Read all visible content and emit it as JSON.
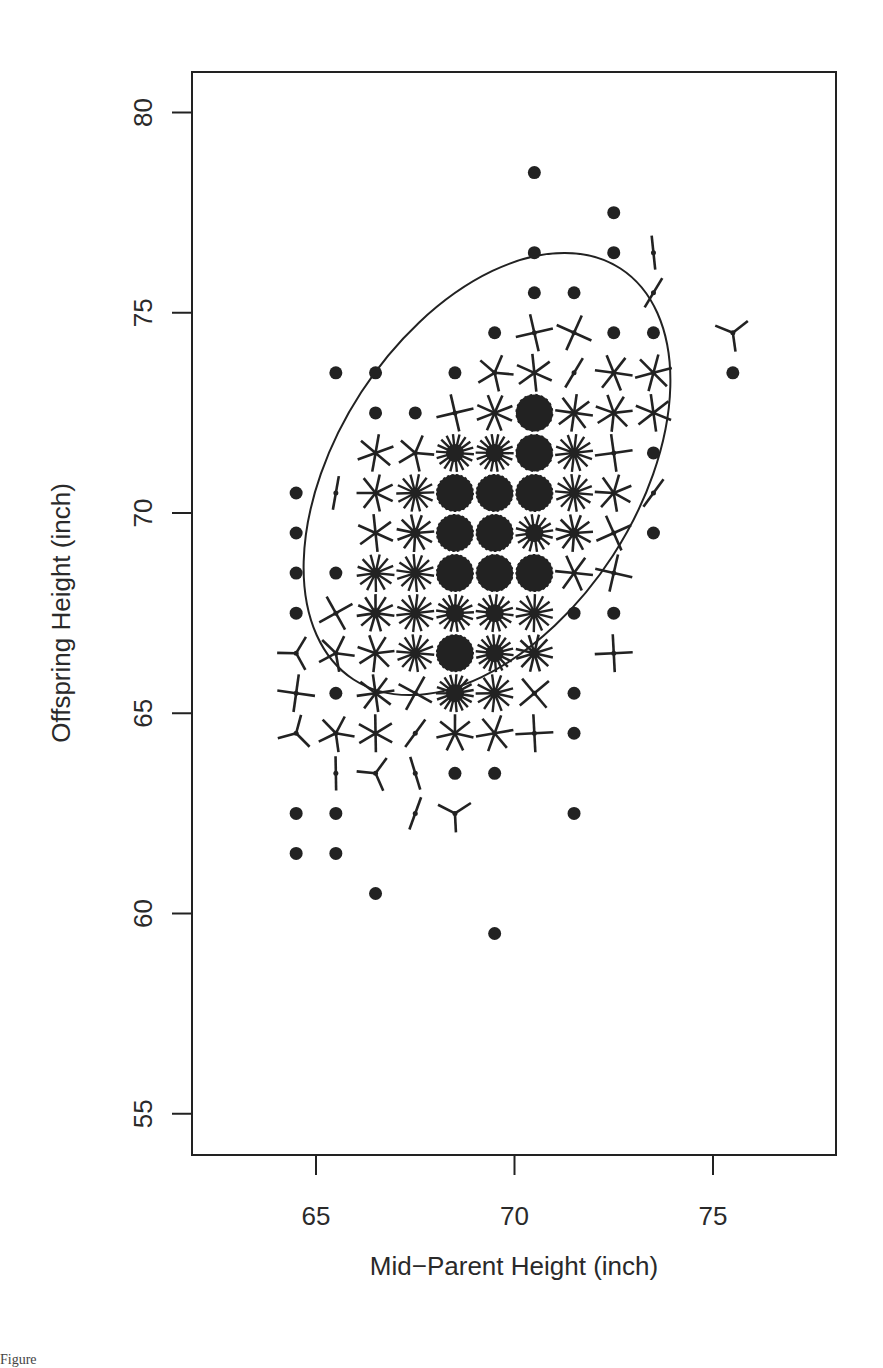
{
  "chart_data": {
    "type": "scatter",
    "subtype": "sunflower",
    "title": "",
    "xlabel": "Mid−Parent Height (inch)",
    "ylabel": "Offspring Height (inch)",
    "xlim": [
      61.9,
      78.2
    ],
    "ylim": [
      54.0,
      81.0
    ],
    "xticks": [
      65,
      70,
      75
    ],
    "yticks": [
      55,
      60,
      65,
      70,
      75,
      80
    ],
    "xtick_labels": [
      "65",
      "70",
      "75"
    ],
    "ytick_labels": [
      "55",
      "60",
      "65",
      "70",
      "75",
      "80"
    ],
    "grid": false,
    "legend": null,
    "ellipse": {
      "center": [
        69.3,
        69.2
      ],
      "note": "concentration ellipse, tilted ~positive correlation"
    },
    "points_legend": "Each symbol marks a grid cell; a dot = 1 observation, each petal = 1 observation, dense cells drawn as filled disks",
    "points": [
      {
        "x": 70.5,
        "y": 78.5,
        "n": 1
      },
      {
        "x": 72.5,
        "y": 77.5,
        "n": 1
      },
      {
        "x": 70.5,
        "y": 76.5,
        "n": 1
      },
      {
        "x": 72.5,
        "y": 76.5,
        "n": 1
      },
      {
        "x": 73.5,
        "y": 76.5,
        "n": 2
      },
      {
        "x": 70.5,
        "y": 75.5,
        "n": 1
      },
      {
        "x": 71.5,
        "y": 75.5,
        "n": 1
      },
      {
        "x": 73.5,
        "y": 75.5,
        "n": 2
      },
      {
        "x": 69.5,
        "y": 74.5,
        "n": 1
      },
      {
        "x": 70.5,
        "y": 74.5,
        "n": 4
      },
      {
        "x": 71.5,
        "y": 74.5,
        "n": 4
      },
      {
        "x": 72.5,
        "y": 74.5,
        "n": 1
      },
      {
        "x": 73.5,
        "y": 74.5,
        "n": 1
      },
      {
        "x": 75.5,
        "y": 74.5,
        "n": 3
      },
      {
        "x": 65.5,
        "y": 73.5,
        "n": 1
      },
      {
        "x": 66.5,
        "y": 73.5,
        "n": 1
      },
      {
        "x": 68.5,
        "y": 73.5,
        "n": 1
      },
      {
        "x": 69.5,
        "y": 73.5,
        "n": 5
      },
      {
        "x": 70.5,
        "y": 73.5,
        "n": 6
      },
      {
        "x": 71.5,
        "y": 73.5,
        "n": 2
      },
      {
        "x": 72.5,
        "y": 73.5,
        "n": 6
      },
      {
        "x": 73.5,
        "y": 73.5,
        "n": 6
      },
      {
        "x": 75.5,
        "y": 73.5,
        "n": 1
      },
      {
        "x": 66.5,
        "y": 72.5,
        "n": 1
      },
      {
        "x": 67.5,
        "y": 72.5,
        "n": 1
      },
      {
        "x": 68.5,
        "y": 72.5,
        "n": 4
      },
      {
        "x": 69.5,
        "y": 72.5,
        "n": 8
      },
      {
        "x": 70.5,
        "y": 72.5,
        "n": 20
      },
      {
        "x": 71.5,
        "y": 72.5,
        "n": 8
      },
      {
        "x": 72.5,
        "y": 72.5,
        "n": 7
      },
      {
        "x": 73.5,
        "y": 72.5,
        "n": 6
      },
      {
        "x": 66.5,
        "y": 71.5,
        "n": 6
      },
      {
        "x": 67.5,
        "y": 71.5,
        "n": 5
      },
      {
        "x": 68.5,
        "y": 71.5,
        "n": 18
      },
      {
        "x": 69.5,
        "y": 71.5,
        "n": 18
      },
      {
        "x": 70.5,
        "y": 71.5,
        "n": 20
      },
      {
        "x": 71.5,
        "y": 71.5,
        "n": 14
      },
      {
        "x": 72.5,
        "y": 71.5,
        "n": 4
      },
      {
        "x": 73.5,
        "y": 71.5,
        "n": 1
      },
      {
        "x": 64.5,
        "y": 70.5,
        "n": 1
      },
      {
        "x": 65.5,
        "y": 70.5,
        "n": 2
      },
      {
        "x": 66.5,
        "y": 70.5,
        "n": 7
      },
      {
        "x": 67.5,
        "y": 70.5,
        "n": 14
      },
      {
        "x": 68.5,
        "y": 70.5,
        "n": 25
      },
      {
        "x": 69.5,
        "y": 70.5,
        "n": 25
      },
      {
        "x": 70.5,
        "y": 70.5,
        "n": 25
      },
      {
        "x": 71.5,
        "y": 70.5,
        "n": 14
      },
      {
        "x": 72.5,
        "y": 70.5,
        "n": 7
      },
      {
        "x": 73.5,
        "y": 70.5,
        "n": 2
      },
      {
        "x": 64.5,
        "y": 69.5,
        "n": 1
      },
      {
        "x": 66.5,
        "y": 69.5,
        "n": 6
      },
      {
        "x": 67.5,
        "y": 69.5,
        "n": 11
      },
      {
        "x": 68.5,
        "y": 69.5,
        "n": 25
      },
      {
        "x": 69.5,
        "y": 69.5,
        "n": 25
      },
      {
        "x": 70.5,
        "y": 69.5,
        "n": 16
      },
      {
        "x": 71.5,
        "y": 69.5,
        "n": 11
      },
      {
        "x": 72.5,
        "y": 69.5,
        "n": 4
      },
      {
        "x": 73.5,
        "y": 69.5,
        "n": 1
      },
      {
        "x": 64.5,
        "y": 68.5,
        "n": 1
      },
      {
        "x": 65.5,
        "y": 68.5,
        "n": 1
      },
      {
        "x": 66.5,
        "y": 68.5,
        "n": 13
      },
      {
        "x": 67.5,
        "y": 68.5,
        "n": 14
      },
      {
        "x": 68.5,
        "y": 68.5,
        "n": 25
      },
      {
        "x": 69.5,
        "y": 68.5,
        "n": 22
      },
      {
        "x": 70.5,
        "y": 68.5,
        "n": 24
      },
      {
        "x": 71.5,
        "y": 68.5,
        "n": 6
      },
      {
        "x": 72.5,
        "y": 68.5,
        "n": 4
      },
      {
        "x": 64.5,
        "y": 67.5,
        "n": 1
      },
      {
        "x": 65.5,
        "y": 67.5,
        "n": 4
      },
      {
        "x": 66.5,
        "y": 67.5,
        "n": 11
      },
      {
        "x": 67.5,
        "y": 67.5,
        "n": 14
      },
      {
        "x": 68.5,
        "y": 67.5,
        "n": 17
      },
      {
        "x": 69.5,
        "y": 67.5,
        "n": 16
      },
      {
        "x": 70.5,
        "y": 67.5,
        "n": 14
      },
      {
        "x": 71.5,
        "y": 67.5,
        "n": 1
      },
      {
        "x": 72.5,
        "y": 67.5,
        "n": 1
      },
      {
        "x": 64.5,
        "y": 66.5,
        "n": 3
      },
      {
        "x": 65.5,
        "y": 66.5,
        "n": 5
      },
      {
        "x": 66.5,
        "y": 66.5,
        "n": 7
      },
      {
        "x": 67.5,
        "y": 66.5,
        "n": 14
      },
      {
        "x": 68.5,
        "y": 66.5,
        "n": 25
      },
      {
        "x": 69.5,
        "y": 66.5,
        "n": 18
      },
      {
        "x": 70.5,
        "y": 66.5,
        "n": 12
      },
      {
        "x": 72.5,
        "y": 66.5,
        "n": 4
      },
      {
        "x": 64.5,
        "y": 65.5,
        "n": 4
      },
      {
        "x": 65.5,
        "y": 65.5,
        "n": 1
      },
      {
        "x": 66.5,
        "y": 65.5,
        "n": 8
      },
      {
        "x": 67.5,
        "y": 65.5,
        "n": 4
      },
      {
        "x": 68.5,
        "y": 65.5,
        "n": 19
      },
      {
        "x": 69.5,
        "y": 65.5,
        "n": 13
      },
      {
        "x": 70.5,
        "y": 65.5,
        "n": 4
      },
      {
        "x": 71.5,
        "y": 65.5,
        "n": 1
      },
      {
        "x": 64.5,
        "y": 64.5,
        "n": 3
      },
      {
        "x": 65.5,
        "y": 64.5,
        "n": 5
      },
      {
        "x": 66.5,
        "y": 64.5,
        "n": 6
      },
      {
        "x": 67.5,
        "y": 64.5,
        "n": 2
      },
      {
        "x": 68.5,
        "y": 64.5,
        "n": 7
      },
      {
        "x": 69.5,
        "y": 64.5,
        "n": 6
      },
      {
        "x": 70.5,
        "y": 64.5,
        "n": 4
      },
      {
        "x": 71.5,
        "y": 64.5,
        "n": 1
      },
      {
        "x": 65.5,
        "y": 63.5,
        "n": 2
      },
      {
        "x": 66.5,
        "y": 63.5,
        "n": 3
      },
      {
        "x": 67.5,
        "y": 63.5,
        "n": 2
      },
      {
        "x": 68.5,
        "y": 63.5,
        "n": 1
      },
      {
        "x": 69.5,
        "y": 63.5,
        "n": 1
      },
      {
        "x": 64.5,
        "y": 62.5,
        "n": 1
      },
      {
        "x": 65.5,
        "y": 62.5,
        "n": 1
      },
      {
        "x": 67.5,
        "y": 62.5,
        "n": 2
      },
      {
        "x": 68.5,
        "y": 62.5,
        "n": 3
      },
      {
        "x": 71.5,
        "y": 62.5,
        "n": 1
      },
      {
        "x": 64.5,
        "y": 61.5,
        "n": 1
      },
      {
        "x": 65.5,
        "y": 61.5,
        "n": 1
      },
      {
        "x": 66.5,
        "y": 60.5,
        "n": 1
      },
      {
        "x": 69.5,
        "y": 59.5,
        "n": 1
      }
    ]
  },
  "caption_fragment": "Figure"
}
